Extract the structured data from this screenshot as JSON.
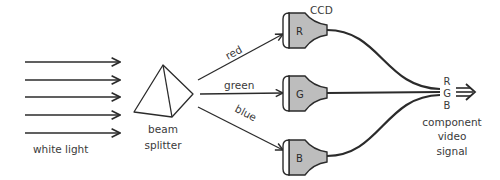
{
  "diagram": {
    "input": {
      "label": "white light",
      "ray_count": 5
    },
    "splitter": {
      "label_line1": "beam",
      "label_line2": "splitter"
    },
    "beams": [
      {
        "label": "red",
        "color_name": "red"
      },
      {
        "label": "green",
        "color_name": "green"
      },
      {
        "label": "blue",
        "color_name": "blue"
      }
    ],
    "sensors": {
      "label": "CCD",
      "items": [
        {
          "letter": "R"
        },
        {
          "letter": "G"
        },
        {
          "letter": "B"
        }
      ]
    },
    "output": {
      "channels": [
        "R",
        "G",
        "B"
      ],
      "label_line1": "component",
      "label_line2": "video",
      "label_line3": "signal"
    },
    "colors": {
      "line": "#2b2b2b",
      "sensor_fill": "#bdbdbd",
      "text": "#3a3a3a",
      "background": "#ffffff"
    }
  }
}
